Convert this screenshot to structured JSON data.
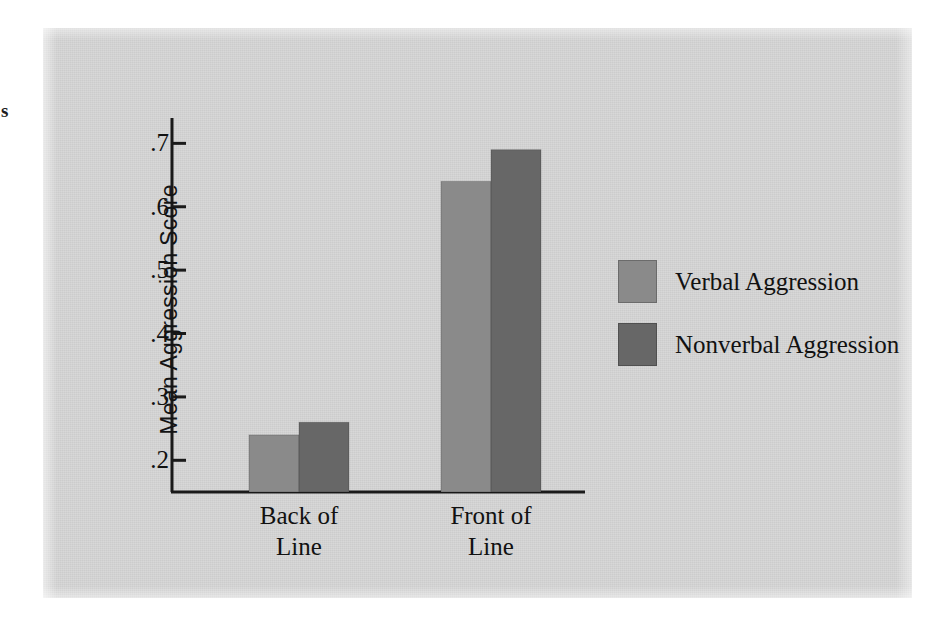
{
  "stray_glyph": "s",
  "chart_data": {
    "type": "bar",
    "title": "",
    "subtitle": "",
    "xlabel": "",
    "ylabel": "Mean Aggression Score",
    "categories": [
      "Back of Line",
      "Front of Line"
    ],
    "category_lines": [
      {
        "line1": "Back of",
        "line2": "Line"
      },
      {
        "line1": "Front of",
        "line2": "Line"
      }
    ],
    "series": [
      {
        "name": "Verbal Aggression",
        "color": "#8a8a8a",
        "values": [
          0.24,
          0.64
        ]
      },
      {
        "name": "Nonverbal Aggression",
        "color": "#676767",
        "values": [
          0.26,
          0.69
        ]
      }
    ],
    "ylim": [
      0.15,
      0.74
    ],
    "yticks": [
      0.2,
      0.3,
      0.4,
      0.5,
      0.6,
      0.7
    ],
    "ytick_labels": [
      ".2",
      ".3",
      ".4",
      ".5",
      ".6",
      ".7"
    ],
    "grid": false,
    "legend_position": "right",
    "annotations": []
  },
  "legend": {
    "items": [
      {
        "label": "Verbal Aggression",
        "color": "#8a8a8a"
      },
      {
        "label": "Nonverbal Aggression",
        "color": "#676767"
      }
    ]
  },
  "colors": {
    "panel_background": "#d6d6d6",
    "page_background": "#ffffff",
    "axis": "#1a1a1a",
    "text": "#111111",
    "verbal_bar": "#8a8a8a",
    "nonverbal_bar": "#676767"
  },
  "axis": {
    "y_tick_0": ".2",
    "y_tick_1": ".3",
    "y_tick_2": ".4",
    "y_tick_3": ".5",
    "y_tick_4": ".6",
    "y_tick_5": ".7"
  }
}
